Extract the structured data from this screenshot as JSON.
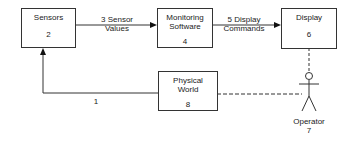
{
  "diagram": {
    "nodes": [
      {
        "id": "sensors",
        "title": "Sensors",
        "number": "2"
      },
      {
        "id": "monitoring",
        "title": "Monitoring Software",
        "title_line1": "Monitoring",
        "title_line2": "Software",
        "number": "4"
      },
      {
        "id": "display",
        "title": "Display",
        "number": "6"
      },
      {
        "id": "physical",
        "title": "Physical World",
        "title_line1": "Physical",
        "title_line2": "World",
        "number": "8"
      }
    ],
    "actor": {
      "label": "Operator",
      "number": "7"
    },
    "edges": [
      {
        "from": "physical",
        "to": "sensors",
        "label": "1",
        "style": "solid",
        "arrow": true
      },
      {
        "from": "sensors",
        "to": "monitoring",
        "label": "3 Sensor Values",
        "label_line1": "3 Sensor",
        "label_line2": "Values",
        "style": "solid",
        "arrow": true
      },
      {
        "from": "monitoring",
        "to": "display",
        "label": "5 Display Commands",
        "label_line1": "5 Display",
        "label_line2": "Commands",
        "style": "solid",
        "arrow": true
      },
      {
        "from": "display",
        "to": "operator",
        "label": "",
        "style": "dashed",
        "arrow": false
      },
      {
        "from": "physical",
        "to": "operator",
        "label": "",
        "style": "dashed",
        "arrow": false
      }
    ]
  }
}
